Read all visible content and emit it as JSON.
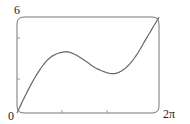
{
  "chart_data": {
    "type": "line",
    "title": "",
    "xlabel": "",
    "ylabel": "",
    "xlim": [
      0,
      6.2832
    ],
    "ylim": [
      0,
      6
    ],
    "x_tick_labels": [
      "0",
      "2π"
    ],
    "y_tick_labels": [
      "6"
    ],
    "grid": false,
    "legend": null,
    "series": [
      {
        "name": "f(x)",
        "x": [
          0,
          0.5,
          1.0,
          1.5,
          2.09,
          2.5,
          3.0,
          3.5,
          4.19,
          4.7,
          5.2,
          5.7,
          6.2832
        ],
        "values": [
          0,
          1.46,
          2.68,
          3.5,
          3.82,
          3.7,
          3.28,
          2.8,
          2.46,
          2.7,
          3.44,
          4.6,
          6.0
        ]
      }
    ],
    "line_color": "#666666"
  },
  "labels": {
    "y_max": "6",
    "x_min": "0",
    "x_max": "2π"
  }
}
